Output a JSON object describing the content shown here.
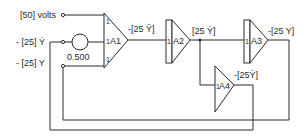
{
  "diagram": {
    "inputs": [
      {
        "id": "in1",
        "label": "[50] volts"
      },
      {
        "id": "in2",
        "label": "- [25] Ẏ"
      },
      {
        "id": "in3",
        "label": "- [25] Y"
      }
    ],
    "potentiometer": {
      "label": "0.500"
    },
    "amplifiers": [
      {
        "id": "A1",
        "label": "A1",
        "gains": [
          "1",
          "1",
          "1"
        ],
        "output": "-[25 Ÿ]"
      },
      {
        "id": "A2",
        "label": "A2",
        "gains": [
          "1"
        ],
        "output": "[25 Ẏ]"
      },
      {
        "id": "A3",
        "label": "A3",
        "gains": [
          "1"
        ],
        "output": "-[25 Y]"
      },
      {
        "id": "A4",
        "label": "A4",
        "gains": [
          "1"
        ],
        "output": "-[25Ẏ]"
      }
    ],
    "colors": {
      "line": "#2a2a2a",
      "background": "#ffffff"
    }
  }
}
